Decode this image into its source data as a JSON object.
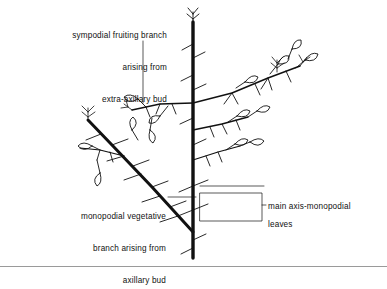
{
  "figure": {
    "title_absent": true,
    "background_color": "#ffffff",
    "ink_color": "#111111",
    "frame": {
      "bottom_rule_color": "#9a9a9a"
    }
  },
  "labels": {
    "sympodial": {
      "line1": "sympodial fruiting branch",
      "line2": "arising from",
      "line3": "extra-axillary bud",
      "align": "right",
      "x": 22,
      "y": 10
    },
    "monopodial": {
      "line1": "monopodial vegetative",
      "line2": "branch arising from",
      "line3": "axillary bud",
      "align": "right",
      "x": 38,
      "y": 193
    },
    "main_axis": {
      "line1": "main axis-monopodial",
      "align": "left",
      "x": 268,
      "y": 186
    },
    "leaves": {
      "line1": "leaves",
      "align": "left",
      "x": 268,
      "y": 203
    }
  },
  "leaders": {
    "sympodial_leader": {
      "type": "vertical-line",
      "from_y": 40,
      "to_y": 103,
      "x": 143
    },
    "monopodial_leader": {
      "type": "horizontal-line",
      "from_x": 168,
      "to_x": 196,
      "y": 197
    },
    "main_axis_leader": {
      "type": "horizontal-line",
      "from_x": 200,
      "to_x": 264,
      "y": 186
    },
    "leaves_bracket": {
      "type": "rectangle",
      "x": 200,
      "y": 193,
      "width": 62,
      "height": 28,
      "tick_to_x": 266,
      "tick_y": 204
    }
  },
  "plant": {
    "main_axis": {
      "description": "thick vertical monopodial stem",
      "x": 193,
      "top_y": 20,
      "bottom_y": 258,
      "stroke_width": 3.2
    },
    "sympodial_branch_count": 2,
    "monopodial_branch_count": 1,
    "leaf_count": 14,
    "bud_cluster_count": 8
  }
}
